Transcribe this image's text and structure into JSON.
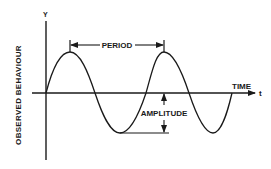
{
  "diagram": {
    "type": "sine-wave-annotation",
    "y_axis_label": "Y",
    "y_axis_title": "OBSERVED  BEHAVIOUR",
    "x_axis_title": "TIME",
    "x_axis_symbol": "t",
    "annotations": {
      "period": "PERIOD",
      "amplitude": "AMPLITUDE"
    },
    "colors": {
      "ink": "#1a1a1a",
      "background": "#ffffff"
    }
  }
}
